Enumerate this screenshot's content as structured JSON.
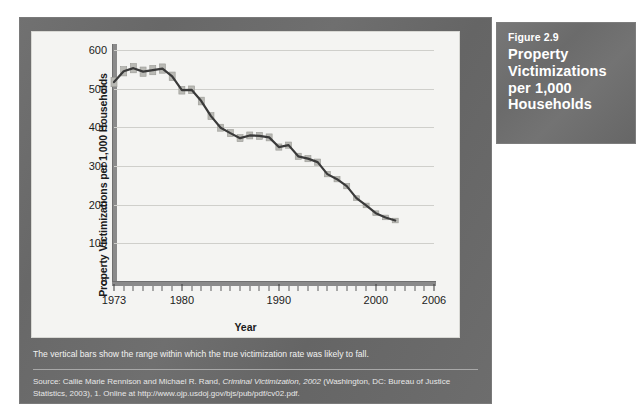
{
  "figure_box": {
    "number": "Figure 2.9",
    "heading": "Property Victimizations per 1,000 Households",
    "background_color": "#6e6e6e",
    "text_color": "#ffffff"
  },
  "panel": {
    "background_color": "#6a6a6a",
    "caption": "The vertical bars show the range within which the true victimization rate was likely to fall.",
    "source_prefix": "Source: Callie Marie Rennison and Michael R. Rand, ",
    "source_italic": "Criminal Victimization, 2002",
    "source_suffix": " (Washington, DC: Bureau of Justice Statistics, 2003), 1. Online at http://www.ojp.usdoj.gov/bjs/pub/pdf/cv02.pdf."
  },
  "chart_data": {
    "type": "line",
    "title": "",
    "xlabel": "Year",
    "ylabel": "Property Victimizations per 1,000 Households",
    "xlim": [
      1973,
      2006
    ],
    "ylim": [
      0,
      600
    ],
    "yticks": [
      0,
      100,
      200,
      300,
      400,
      500,
      600
    ],
    "xticks_labeled": [
      1973,
      1980,
      1990,
      2000,
      2006
    ],
    "xtick_interval": 1,
    "grid": "horizontal",
    "legend": "none",
    "line_color": "#3a3a3a",
    "band_color": "#b9b9b4",
    "band_note": "vertical bars show confidence range",
    "x": [
      1973,
      1974,
      1975,
      1976,
      1977,
      1978,
      1979,
      1980,
      1981,
      1982,
      1983,
      1984,
      1985,
      1986,
      1987,
      1988,
      1989,
      1990,
      1991,
      1992,
      1993,
      1994,
      1995,
      1996,
      1997,
      1998,
      1999,
      2000,
      2001,
      2002
    ],
    "values": [
      517,
      545,
      553,
      544,
      548,
      552,
      532,
      496,
      497,
      468,
      429,
      399,
      385,
      372,
      379,
      378,
      374,
      349,
      354,
      325,
      319,
      310,
      279,
      266,
      248,
      217,
      198,
      178,
      167,
      159
    ],
    "series": [
      {
        "name": "Property victimization rate",
        "values": [
          517,
          545,
          553,
          544,
          548,
          552,
          532,
          496,
          497,
          468,
          429,
          399,
          385,
          372,
          379,
          378,
          374,
          349,
          354,
          325,
          319,
          310,
          279,
          266,
          248,
          217,
          198,
          178,
          167,
          159
        ]
      }
    ],
    "band_low": [
      505,
      533,
      541,
      532,
      536,
      540,
      521,
      486,
      487,
      458,
      420,
      390,
      376,
      363,
      370,
      369,
      365,
      341,
      346,
      317,
      311,
      302,
      272,
      259,
      241,
      211,
      192,
      172,
      161,
      153
    ],
    "band_high": [
      529,
      557,
      565,
      556,
      560,
      564,
      543,
      506,
      507,
      478,
      438,
      408,
      394,
      381,
      388,
      387,
      383,
      357,
      362,
      333,
      327,
      318,
      286,
      273,
      255,
      223,
      204,
      184,
      173,
      165
    ]
  }
}
